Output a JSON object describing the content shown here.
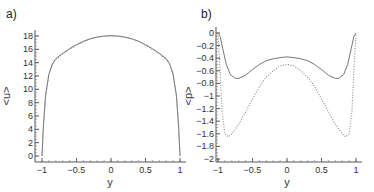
{
  "chart_data": [
    {
      "panel": "a)",
      "type": "line",
      "xlabel": "y",
      "ylabel": "<u>",
      "xlim": [
        -1,
        1
      ],
      "ylim": [
        0,
        18
      ],
      "xticks": [
        "-1",
        "-0.5",
        "0",
        "0.5",
        "1"
      ],
      "yticks": [
        "0",
        "2",
        "4",
        "6",
        "8",
        "10",
        "12",
        "14",
        "16",
        "18"
      ],
      "grid": false,
      "series": [
        {
          "name": "solid",
          "style": "solid",
          "x": [
            -1,
            -0.98,
            -0.95,
            -0.9,
            -0.85,
            -0.8,
            -0.7,
            -0.6,
            -0.5,
            -0.4,
            -0.3,
            -0.2,
            -0.1,
            0,
            0.1,
            0.2,
            0.3,
            0.4,
            0.5,
            0.6,
            0.7,
            0.8,
            0.85,
            0.9,
            0.95,
            0.98,
            1
          ],
          "y": [
            0,
            4.5,
            9,
            12.3,
            13.8,
            14.6,
            15.4,
            16.1,
            16.7,
            17.2,
            17.6,
            17.85,
            18,
            18.05,
            18,
            17.85,
            17.6,
            17.2,
            16.7,
            16.1,
            15.4,
            14.6,
            13.8,
            12.3,
            9,
            4.5,
            0
          ]
        },
        {
          "name": "dotted",
          "style": "dotted",
          "x": [
            -1,
            -0.98,
            -0.95,
            -0.9,
            -0.85,
            -0.8,
            -0.7,
            -0.6,
            -0.5,
            -0.4,
            -0.3,
            -0.2,
            -0.1,
            0,
            0.1,
            0.2,
            0.3,
            0.4,
            0.5,
            0.6,
            0.7,
            0.8,
            0.85,
            0.9,
            0.95,
            0.98,
            1
          ],
          "y": [
            0,
            4.3,
            8.8,
            12.2,
            13.7,
            14.5,
            15.3,
            16.0,
            16.6,
            17.15,
            17.55,
            17.8,
            17.95,
            18.0,
            17.95,
            17.8,
            17.55,
            17.15,
            16.6,
            16.0,
            15.3,
            14.5,
            13.7,
            12.2,
            8.8,
            4.3,
            0
          ]
        }
      ]
    },
    {
      "panel": "b)",
      "type": "line",
      "xlabel": "y",
      "ylabel": "<p>",
      "xlim": [
        -1,
        1
      ],
      "ylim": [
        -2,
        0
      ],
      "xticks": [
        "-1",
        "-0.5",
        "0",
        "0.5",
        "1"
      ],
      "yticks": [
        "0",
        "-0.2",
        "-0.4",
        "-0.6",
        "-0.8",
        "-1",
        "-1.2",
        "-1.4",
        "-1.6",
        "-1.8",
        "-2"
      ],
      "grid": false,
      "series": [
        {
          "name": "solid",
          "style": "solid",
          "x": [
            -1,
            -0.97,
            -0.93,
            -0.88,
            -0.82,
            -0.75,
            -0.7,
            -0.6,
            -0.5,
            -0.4,
            -0.3,
            -0.2,
            -0.1,
            0,
            0.1,
            0.2,
            0.3,
            0.4,
            0.5,
            0.6,
            0.7,
            0.75,
            0.82,
            0.88,
            0.93,
            0.97,
            1
          ],
          "y": [
            0,
            -0.05,
            -0.25,
            -0.5,
            -0.66,
            -0.72,
            -0.72,
            -0.67,
            -0.58,
            -0.5,
            -0.44,
            -0.41,
            -0.39,
            -0.38,
            -0.39,
            -0.41,
            -0.44,
            -0.5,
            -0.58,
            -0.67,
            -0.72,
            -0.72,
            -0.66,
            -0.5,
            -0.25,
            -0.05,
            0
          ]
        },
        {
          "name": "dotted",
          "style": "dotted",
          "x": [
            -1,
            -0.97,
            -0.94,
            -0.9,
            -0.85,
            -0.8,
            -0.7,
            -0.6,
            -0.5,
            -0.4,
            -0.3,
            -0.2,
            -0.1,
            0,
            0.1,
            0.2,
            0.3,
            0.4,
            0.5,
            0.6,
            0.7,
            0.8,
            0.85,
            0.9,
            0.94,
            0.97,
            1
          ],
          "y": [
            0,
            -0.6,
            -1.25,
            -1.6,
            -1.65,
            -1.6,
            -1.45,
            -1.25,
            -1.05,
            -0.85,
            -0.7,
            -0.6,
            -0.52,
            -0.5,
            -0.52,
            -0.6,
            -0.7,
            -0.85,
            -1.05,
            -1.25,
            -1.45,
            -1.6,
            -1.65,
            -1.6,
            -1.25,
            -0.6,
            0
          ]
        }
      ]
    }
  ]
}
